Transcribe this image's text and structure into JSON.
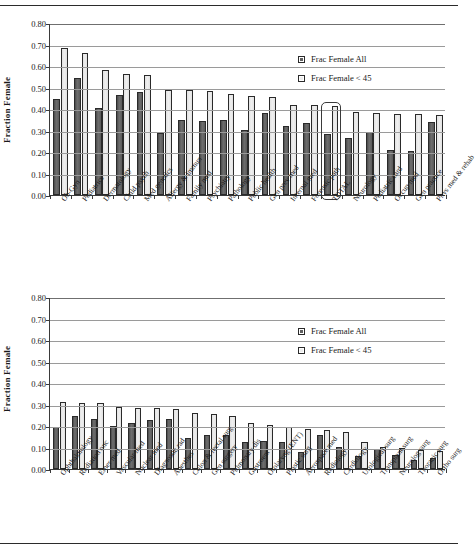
{
  "figure": {
    "ylabel": "Fraction Female",
    "ytick_labels": [
      "0.80",
      "0.70",
      "0.60",
      "0.50",
      "0.40",
      "0.30",
      "0.20",
      "0.10",
      "0.00"
    ],
    "legend": {
      "all_label": "Frac Female All",
      "u45_label": "Frac Female < 45"
    },
    "colors": {
      "series_all": "#5f5f5f",
      "series_u45": "#ededed",
      "axis": "#3a3a3a",
      "grid": "#9a9a9a"
    }
  },
  "chart_data": [
    {
      "type": "bar",
      "title": "",
      "xlabel": "",
      "ylabel": "Fraction Female",
      "ylim": [
        0,
        0.8
      ],
      "ytick_step": 0.1,
      "grid": true,
      "legend_position": "top-right",
      "highlighted_category": "TOTAL",
      "categories": [
        "Ob-Gyn",
        "Pediatrics",
        "Dermatology",
        "Child psych",
        "Med genetics",
        "Allergy & immun",
        "Family med",
        "Psychiatry",
        "Pathology",
        "Public health",
        "Gen prev med",
        "Internal med",
        "Forensic path",
        "TOTAL",
        "Neurology",
        "Pediatric card",
        "Occup med",
        "Gen practice",
        "Phys med & rehab"
      ],
      "series": [
        {
          "name": "Frac Female All",
          "values": [
            0.445,
            0.546,
            0.405,
            0.466,
            0.477,
            0.288,
            0.35,
            0.345,
            0.35,
            0.303,
            0.38,
            0.323,
            0.336,
            0.285,
            0.264,
            0.292,
            0.211,
            0.205,
            0.339
          ]
        },
        {
          "name": "Frac Female < 45",
          "values": [
            0.683,
            0.659,
            0.58,
            0.561,
            0.557,
            0.489,
            0.488,
            0.483,
            0.471,
            0.461,
            0.458,
            0.421,
            0.417,
            0.415,
            0.388,
            0.382,
            0.379,
            0.378,
            0.373
          ]
        }
      ]
    },
    {
      "type": "bar",
      "title": "",
      "xlabel": "",
      "ylabel": "Fraction Female",
      "ylim": [
        0,
        0.8
      ],
      "ytick_step": 0.1,
      "grid": true,
      "legend_position": "top-right",
      "highlighted_category": null,
      "categories": [
        "Ophthalmology",
        "Radiation onc",
        "Emer med",
        "Vascular med",
        "Nuclear med",
        "Diagnostic rad",
        "Anesthes",
        "Colon & rectal surg",
        "Gen surgery",
        "Pulmonary dis",
        "Gastroent",
        "Otolaryng (ENT)",
        "Plastic surg",
        "Aerospace med",
        "Radiology",
        "Cardiology",
        "Urological surg",
        "Transplant surg",
        "Neurolog surg",
        "Thoracic surg",
        "Ortho surg"
      ],
      "series": [
        {
          "name": "Frac Female All",
          "values": [
            0.194,
            0.248,
            0.232,
            0.201,
            0.213,
            0.226,
            0.231,
            0.143,
            0.157,
            0.158,
            0.124,
            0.129,
            0.126,
            0.08,
            0.159,
            0.102,
            0.059,
            0.095,
            0.064,
            0.044,
            0.052
          ]
        },
        {
          "name": "Frac Female < 45",
          "values": [
            0.31,
            0.309,
            0.308,
            0.288,
            0.285,
            0.282,
            0.279,
            0.26,
            0.254,
            0.246,
            0.215,
            0.206,
            0.196,
            0.187,
            0.183,
            0.174,
            0.127,
            0.102,
            0.098,
            0.087,
            0.085
          ]
        }
      ]
    }
  ]
}
